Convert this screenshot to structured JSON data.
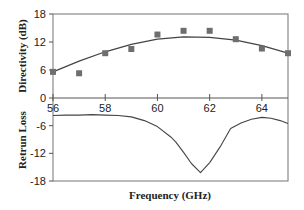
{
  "chart_data": [
    {
      "type": "scatter",
      "panel": "top",
      "title": "",
      "xlabel": "Frequency (GHz)",
      "ylabel": "Directivity (dB)",
      "xlim": [
        56,
        65
      ],
      "ylim": [
        0,
        18
      ],
      "yticks": [
        0,
        6,
        12,
        18
      ],
      "xticks": [
        56,
        58,
        60,
        62,
        64
      ],
      "grid": false,
      "legend": null,
      "series": [
        {
          "name": "Measured directivity",
          "style": "markers",
          "marker": "square",
          "color": "#6e6e6e",
          "x": [
            56,
            57,
            58,
            59,
            60,
            61,
            62,
            63,
            64,
            65
          ],
          "y": [
            5.6,
            5.3,
            9.6,
            10.5,
            13.6,
            14.4,
            14.4,
            12.6,
            10.6,
            9.6
          ]
        },
        {
          "name": "Fitted curve",
          "style": "line",
          "color": "#444444",
          "x": [
            56,
            57,
            58,
            59,
            60,
            61,
            62,
            63,
            64,
            65
          ],
          "y": [
            5.6,
            7.9,
            9.9,
            11.5,
            12.6,
            13.1,
            13.0,
            12.4,
            11.2,
            9.6
          ]
        }
      ]
    },
    {
      "type": "line",
      "panel": "bottom",
      "title": "",
      "xlabel": "Frequency (GHz)",
      "ylabel": "Retrun Loss",
      "xlim": [
        56,
        65
      ],
      "ylim": [
        -18,
        0
      ],
      "yticks": [
        -6,
        -12,
        -18
      ],
      "xticks": [
        56,
        58,
        60,
        62,
        64
      ],
      "xtick_labels": [
        "56",
        "58",
        "60",
        "62",
        "64"
      ],
      "grid": false,
      "legend": null,
      "series": [
        {
          "name": "Return loss",
          "color": "#444444",
          "x": [
            56,
            56.5,
            57,
            57.5,
            58,
            58.5,
            59,
            59.5,
            60,
            60.5,
            60.7,
            61,
            61.3,
            61.65,
            62,
            62.4,
            62.8,
            63.2,
            63.6,
            64,
            64.35,
            64.7,
            65
          ],
          "y": [
            -3.8,
            -3.7,
            -3.7,
            -3.6,
            -3.7,
            -3.8,
            -4.1,
            -4.9,
            -6.2,
            -8.4,
            -9.5,
            -11.8,
            -14.2,
            -16.2,
            -14.0,
            -10.6,
            -6.6,
            -5.4,
            -4.6,
            -4.2,
            -4.4,
            -4.9,
            -5.5
          ]
        }
      ]
    }
  ],
  "labels": {
    "top_ylabel": "Directivity (dB)",
    "bottom_ylabel": "Retrun Loss",
    "xlabel": "Frequency (GHz)",
    "top_yticks": [
      "18",
      "12",
      "6",
      "0"
    ],
    "bottom_yticks": [
      "-6",
      "-12",
      "-18"
    ],
    "xticks": [
      "56",
      "58",
      "60",
      "62",
      "64"
    ]
  }
}
